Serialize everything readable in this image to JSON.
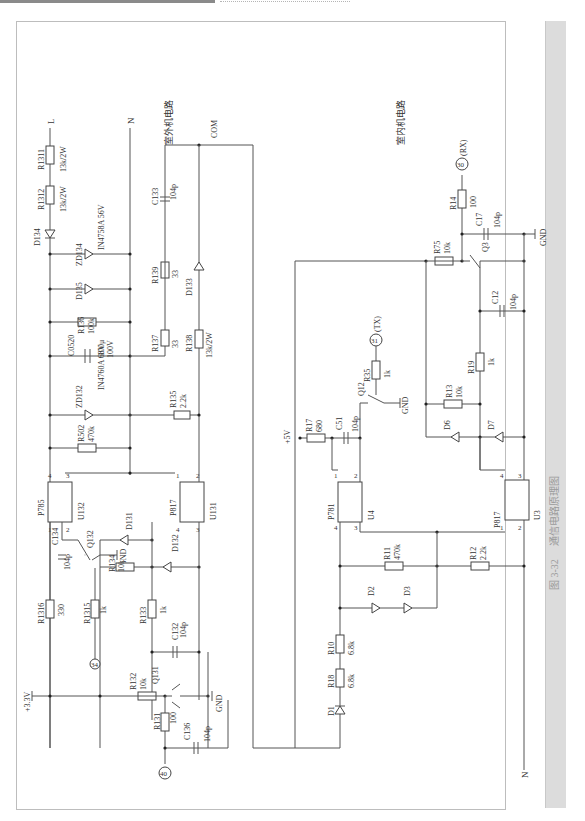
{
  "figure": {
    "caption_number": "图 3-32",
    "caption_title": "通信电路原理图",
    "outdoor_label": "室外机电路",
    "indoor_label": "室内机电路"
  },
  "nets": {
    "L": "L",
    "N_out": "N",
    "N_in": "N",
    "COM": "COM",
    "v33": "+3.3V",
    "v5": "+5V",
    "gnd": "GND"
  },
  "pins": {
    "p40": "40",
    "p34": "34",
    "p31": "31",
    "p31_label": "(TX)",
    "p30": "30",
    "p30_label": "(RX)"
  },
  "outdoor_components": {
    "R1311": {
      "ref": "R1311",
      "value": "13k/2W"
    },
    "R1312": {
      "ref": "R1312",
      "value": "13k/2W"
    },
    "D134": {
      "ref": "D134"
    },
    "ZD134": {
      "ref": "ZD134",
      "value": "IN4758A  56V"
    },
    "D135": {
      "ref": "D135"
    },
    "R136": {
      "ref": "R136",
      "value": "100k"
    },
    "C0520": {
      "ref": "C0520",
      "value": "100μ",
      "value2": "100V"
    },
    "ZD132": {
      "ref": "ZD132",
      "value": "IN4760A 68V"
    },
    "R502": {
      "ref": "R502",
      "value": "470k"
    },
    "C133": {
      "ref": "C133",
      "value": "104p"
    },
    "R139": {
      "ref": "R139",
      "value": "33"
    },
    "D133": {
      "ref": "D133"
    },
    "R137": {
      "ref": "R137",
      "value": "33"
    },
    "R138": {
      "ref": "R138",
      "value": "13k/2W"
    },
    "R135": {
      "ref": "R135",
      "value": "2.2k"
    },
    "U132": {
      "ref": "U132",
      "part": "P785",
      "pins": [
        "1",
        "2",
        "3",
        "4"
      ]
    },
    "U131": {
      "ref": "U131",
      "part": "P817",
      "pins": [
        "1",
        "2",
        "3",
        "4"
      ]
    },
    "C134": {
      "ref": "C134",
      "value": "104p"
    },
    "Q132": {
      "ref": "Q132"
    },
    "D131": {
      "ref": "D131"
    },
    "R134": {
      "ref": "R134",
      "value": "10k"
    },
    "D132": {
      "ref": "D132"
    },
    "R1316": {
      "ref": "R1316",
      "value": "330"
    },
    "R1315": {
      "ref": "R1315",
      "value": "1k"
    },
    "R133": {
      "ref": "R133",
      "value": "1k"
    },
    "C132": {
      "ref": "C132",
      "value": "104p"
    },
    "R132": {
      "ref": "R132",
      "value": "10k"
    },
    "Q131": {
      "ref": "Q131"
    },
    "R131": {
      "ref": "R131",
      "value": "100"
    },
    "C136": {
      "ref": "C136",
      "value": "104p"
    }
  },
  "indoor_components": {
    "R14": {
      "ref": "R14",
      "value": "100"
    },
    "C17": {
      "ref": "C17",
      "value": "104p"
    },
    "R75": {
      "ref": "R75",
      "value": "10k"
    },
    "Q3": {
      "ref": "Q3"
    },
    "C12": {
      "ref": "C12",
      "value": "104p"
    },
    "R19": {
      "ref": "R19",
      "value": "1k"
    },
    "R13": {
      "ref": "R13",
      "value": "10k"
    },
    "D6": {
      "ref": "D6"
    },
    "D7": {
      "ref": "D7"
    },
    "R35": {
      "ref": "R35",
      "value": "1k"
    },
    "Q12": {
      "ref": "Q12"
    },
    "R17": {
      "ref": "R17",
      "value": "680"
    },
    "C51": {
      "ref": "C51",
      "value": "104p"
    },
    "U4": {
      "ref": "U4",
      "part": "P781",
      "pins": [
        "1",
        "2",
        "3",
        "4"
      ]
    },
    "U3": {
      "ref": "U3",
      "part": "P817",
      "pins": [
        "1",
        "2",
        "3",
        "4"
      ]
    },
    "R11": {
      "ref": "R11",
      "value": "470k"
    },
    "R12": {
      "ref": "R12",
      "value": "2.2k"
    },
    "D2": {
      "ref": "D2"
    },
    "D3": {
      "ref": "D3"
    },
    "R10": {
      "ref": "R10",
      "value": "6.8k"
    },
    "R18": {
      "ref": "R18",
      "value": "6.8k"
    },
    "D1": {
      "ref": "D1"
    }
  }
}
